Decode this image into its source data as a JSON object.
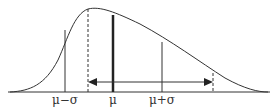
{
  "diagram": {
    "type": "skewed-distribution",
    "colors": {
      "stroke": "#333333",
      "background": "#ffffff"
    },
    "labels": {
      "mu_minus_sigma": "μ−σ",
      "mu": "μ",
      "mu_plus_sigma": "μ+σ"
    },
    "markers": [
      {
        "name": "mu-minus-sigma",
        "x": 65,
        "style": "thin-solid"
      },
      {
        "name": "mode",
        "x": 88,
        "style": "dashed"
      },
      {
        "name": "mu",
        "x": 113,
        "style": "thick-solid"
      },
      {
        "name": "mu-plus-sigma",
        "x": 162,
        "style": "thin-solid"
      },
      {
        "name": "right-bound",
        "x": 213,
        "style": "dashed"
      }
    ],
    "arrow": {
      "from_x": 88,
      "to_x": 213,
      "y": 82,
      "heads": "both"
    }
  }
}
